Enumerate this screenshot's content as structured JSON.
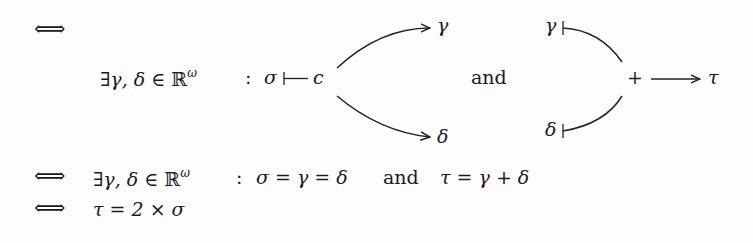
{
  "formula": {
    "line1": {
      "iff": "⟺"
    },
    "line2": {
      "exists_clause": "∃γ, δ ∈ ",
      "field": "ℝ",
      "field_sup": "ω",
      "colon": ":",
      "sigma": "σ",
      "mapsto": "↦",
      "c": "c",
      "gamma_target": "γ",
      "delta_target": "δ",
      "and": "and",
      "gamma_source": "γ",
      "delta_source": "δ",
      "plus": "+",
      "tau": "τ"
    },
    "line3": {
      "iff": "⟺",
      "exists_clause": "∃γ, δ ∈ ",
      "field": "ℝ",
      "field_sup": "ω",
      "colon": ":",
      "equation1": "σ = γ = δ",
      "and": "and",
      "equation2": "τ = γ + δ"
    },
    "line4": {
      "iff": "⟺",
      "equation": "τ = 2 × σ"
    }
  }
}
